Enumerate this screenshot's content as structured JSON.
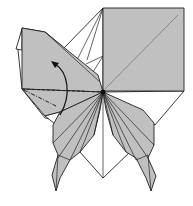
{
  "diagram": {
    "colors": {
      "paper": "#c0c0c0",
      "background": "#ffffff",
      "line": "#222222",
      "diagonal": "#777777"
    },
    "elements": [
      {
        "name": "square-flap",
        "description": "upper-right gray square with diagonal crease"
      },
      {
        "name": "left-flap",
        "description": "upper-left gray flap to be folded"
      },
      {
        "name": "valley-fold-line",
        "style": "dashed"
      },
      {
        "name": "mountain-fold-line",
        "style": "dash-dot"
      },
      {
        "name": "fold-arrow",
        "description": "curved arrow indicating fold upward"
      },
      {
        "name": "left-wing",
        "description": "lower-left pleated wing"
      },
      {
        "name": "right-wing",
        "description": "lower-right pleated wing"
      },
      {
        "name": "center-point",
        "description": "radiating pleats meet at center"
      }
    ]
  }
}
